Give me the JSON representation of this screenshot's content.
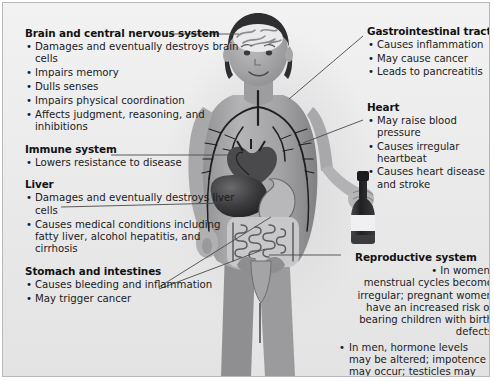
{
  "figure": {
    "style": "grayscale anatomical illustration"
  },
  "callouts": [
    {
      "id": "brain",
      "heading": "Brain and central nervous system",
      "side": "left",
      "bullets": [
        "Damages and eventually destroys brain cells",
        "Impairs memory",
        "Dulls senses",
        "Impairs physical coordination",
        "Affects judgment, reasoning, and inhibitions"
      ]
    },
    {
      "id": "immune",
      "heading": "Immune system",
      "side": "left",
      "bullets": [
        "Lowers resistance to disease"
      ]
    },
    {
      "id": "liver",
      "heading": "Liver",
      "side": "left",
      "bullets": [
        "Damages and eventually destroys liver cells",
        "Causes medical conditions including fatty liver, alcohol hepatitis, and cirrhosis"
      ]
    },
    {
      "id": "stomach",
      "heading": "Stomach and intestines",
      "side": "left",
      "bullets": [
        "Causes bleeding and inflammation",
        "May trigger cancer"
      ]
    },
    {
      "id": "gi",
      "heading": "Gastrointestinal tract",
      "side": "right",
      "bullets": [
        "Causes inflammation",
        "May cause cancer",
        "Leads to pancreatitis"
      ]
    },
    {
      "id": "heart",
      "heading": "Heart",
      "side": "right",
      "bullets": [
        "May raise blood pressure",
        "Causes irregular heartbeat",
        "Causes heart disease and stroke"
      ]
    },
    {
      "id": "reproductive",
      "heading": "Reproductive system",
      "side": "right",
      "bullets": [
        "In women, menstrual cycles become irregular; pregnant women have an increased risk of bearing children with birth defects",
        "In men, hormone levels may be altered; impotence may occur; testicles may atrophy"
      ]
    }
  ],
  "bullet_glyph": "•",
  "colors": {
    "panel_bg": "#ececed",
    "panel_border": "#b9b9bb",
    "heading_text": "#121212",
    "body_text": "#1b1b1b",
    "leader_line": "#4a4a4a",
    "skin_mid": "#9a9a9c",
    "skin_light": "#c3c3c5",
    "skin_dark": "#7c7c7e",
    "hair": "#2e2e30",
    "organ_dark": "#3a3a3c",
    "organ_mid": "#6e6e70",
    "organ_light": "#d8d8da",
    "vessel": "#1f1f21",
    "bottle_dark": "#2b2b2d",
    "bottle_label": "#f0f0f0"
  },
  "repro_lines": {
    "w1": "In women, menstrual",
    "w2": "cycles become irregular;",
    "w3": "pregnant women have an",
    "w4": "increased risk of bearing",
    "w5": "children with birth defects",
    "m": "In men, hormone levels may altered; impotence may occur; testicles may atrophy"
  }
}
